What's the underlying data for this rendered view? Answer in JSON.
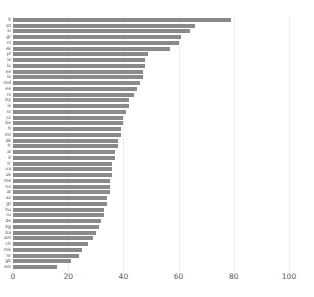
{
  "chart_data": {
    "type": "bar",
    "orientation": "horizontal",
    "title": "",
    "subtitle": "",
    "xlabel": "",
    "ylabel": "",
    "xlim": [
      0,
      108
    ],
    "xticks": [
      0,
      20,
      40,
      60,
      80,
      100
    ],
    "xtick_labels": [
      "0",
      "20",
      "40",
      "60",
      "80",
      "100"
    ],
    "grid": "vertical-dotted",
    "legend": "none",
    "bar_color": "#8a8a8a",
    "axis_text_color": "#55565a",
    "label_text_color": "#4d4d4d",
    "background": "#ffffff",
    "categories": [
      "lt",
      "pt",
      "si",
      "gr",
      "nl",
      "sk",
      "pl",
      "ie",
      "lu",
      "se",
      "lv",
      "md",
      "ee",
      "rs",
      "by",
      "is",
      "ro",
      "cz",
      "be",
      "fi",
      "mt",
      "dk",
      "fr",
      "al",
      "it",
      "tr",
      "ua",
      "uk",
      "me",
      "no",
      "at",
      "az",
      "gt",
      "hu",
      "ru",
      "de",
      "bg",
      "ba",
      "am",
      "ch",
      "mk",
      "nr",
      "gb"
    ],
    "values": [
      79,
      66,
      64,
      61,
      60,
      57,
      49,
      48,
      48,
      47,
      46,
      46,
      45,
      44,
      42,
      42,
      41,
      40,
      40,
      39,
      39,
      38,
      38,
      37,
      37,
      36,
      36,
      36,
      35,
      35,
      34,
      34,
      33,
      33,
      32,
      32,
      31,
      31,
      30,
      29,
      28,
      27,
      25
    ],
    "series": [
      {
        "name": "value",
        "values": [
          79,
          66,
          64,
          61,
          60,
          57,
          49,
          48,
          48,
          47,
          46,
          46,
          45,
          44,
          42,
          42,
          41,
          40,
          40,
          39,
          39,
          38,
          38,
          37,
          37,
          36,
          36,
          36,
          35,
          35,
          34,
          34,
          33,
          33,
          32,
          32,
          31,
          31,
          30,
          29,
          28,
          27,
          25
        ]
      }
    ],
    "bars": [
      {
        "label": "lt",
        "value": 79
      },
      {
        "label": "pt",
        "value": 66
      },
      {
        "label": "si",
        "value": 64
      },
      {
        "label": "gr",
        "value": 61
      },
      {
        "label": "nl",
        "value": 60
      },
      {
        "label": "sk",
        "value": 57
      },
      {
        "label": "pl",
        "value": 49
      },
      {
        "label": "ie",
        "value": 48
      },
      {
        "label": "lu",
        "value": 48
      },
      {
        "label": "se",
        "value": 47
      },
      {
        "label": "lv",
        "value": 47
      },
      {
        "label": "md",
        "value": 46
      },
      {
        "label": "ee",
        "value": 45
      },
      {
        "label": "rs",
        "value": 44
      },
      {
        "label": "by",
        "value": 42
      },
      {
        "label": "is",
        "value": 42
      },
      {
        "label": "ro",
        "value": 41
      },
      {
        "label": "cz",
        "value": 40
      },
      {
        "label": "be",
        "value": 40
      },
      {
        "label": "fi",
        "value": 39
      },
      {
        "label": "mt",
        "value": 39
      },
      {
        "label": "dk",
        "value": 38
      },
      {
        "label": "fr",
        "value": 38
      },
      {
        "label": "al",
        "value": 37
      },
      {
        "label": "it",
        "value": 37
      },
      {
        "label": "tr",
        "value": 36
      },
      {
        "label": "ua",
        "value": 36
      },
      {
        "label": "uk",
        "value": 36
      },
      {
        "label": "me",
        "value": 35
      },
      {
        "label": "no",
        "value": 35
      },
      {
        "label": "at",
        "value": 35
      },
      {
        "label": "az",
        "value": 34
      },
      {
        "label": "gt",
        "value": 34
      },
      {
        "label": "hu",
        "value": 33
      },
      {
        "label": "ru",
        "value": 33
      },
      {
        "label": "de",
        "value": 32
      },
      {
        "label": "bg",
        "value": 31
      },
      {
        "label": "ba",
        "value": 30
      },
      {
        "label": "am",
        "value": 29
      },
      {
        "label": "ch",
        "value": 27
      },
      {
        "label": "mk",
        "value": 25
      },
      {
        "label": "nr",
        "value": 24
      },
      {
        "label": "gb",
        "value": 21
      },
      {
        "label": "sm",
        "value": 16
      }
    ]
  }
}
